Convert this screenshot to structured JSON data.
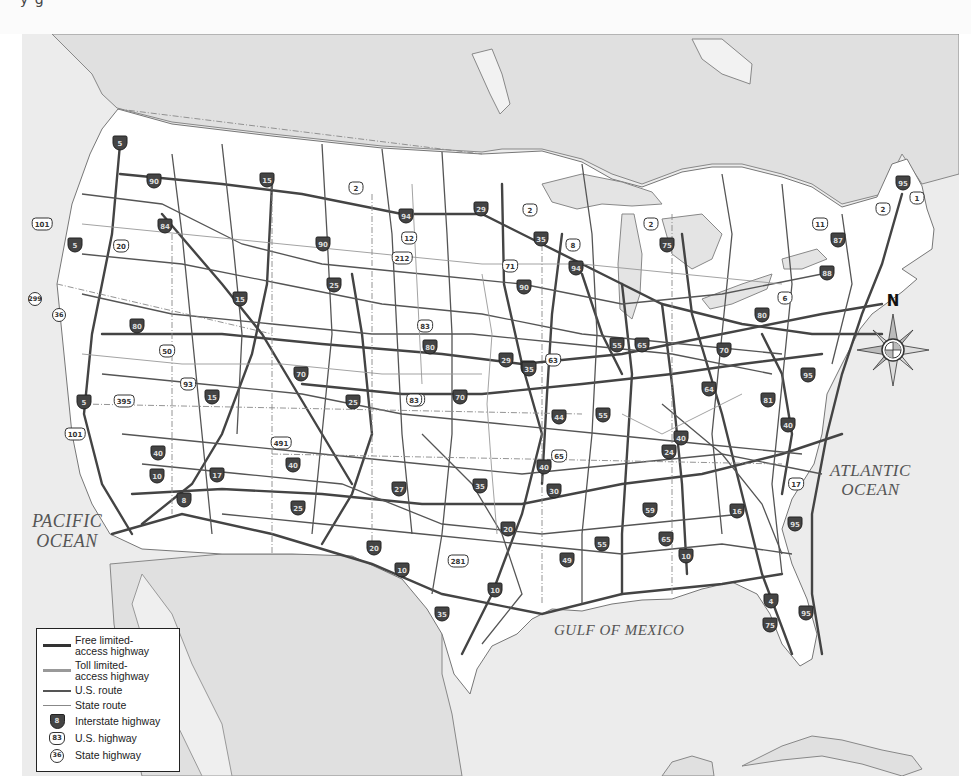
{
  "header": {
    "cropped_text": "y                   g"
  },
  "map": {
    "title": "United States highway map",
    "colors": {
      "foreign_land": "#e2e2e2",
      "water": "#eeeeee",
      "us_land": "#ffffff",
      "interstate": "#444444",
      "toll": "#9a9a9a",
      "us_route": "#555555",
      "state_route": "#888888",
      "border": "#777777"
    },
    "labels": {
      "pacific_ocean": "PACIFIC OCEAN",
      "pacific_line1": "PACIFIC",
      "pacific_line2": "OCEAN",
      "atlantic_ocean": "ATLANTIC OCEAN",
      "atlantic_line1": "ATLANTIC",
      "atlantic_line2": "OCEAN",
      "gulf_of_mexico": "GULF OF MEXICO"
    },
    "compass": {
      "north_label": "N"
    },
    "legend": {
      "items": [
        {
          "symbol": "line-dark-thick",
          "label_line1": "Free limited-",
          "label_line2": "access highway"
        },
        {
          "symbol": "line-gray-thick",
          "label_line1": "Toll limited-",
          "label_line2": "access highway"
        },
        {
          "symbol": "line-dark",
          "label_line1": "U.S. route",
          "label_line2": ""
        },
        {
          "symbol": "line-gray",
          "label_line1": "State route",
          "label_line2": ""
        },
        {
          "symbol": "interstate-shield",
          "shield_text": "8",
          "label_line1": "Interstate highway",
          "label_line2": ""
        },
        {
          "symbol": "us-shield",
          "shield_text": "83",
          "label_line1": "U.S. highway",
          "label_line2": ""
        },
        {
          "symbol": "state-circle",
          "shield_text": "36",
          "label_line1": "State highway",
          "label_line2": ""
        }
      ]
    },
    "shields": [
      {
        "type": "interstate",
        "text": "5",
        "x": 120,
        "y": 143
      },
      {
        "type": "interstate",
        "text": "5",
        "x": 75,
        "y": 245
      },
      {
        "type": "interstate",
        "text": "5",
        "x": 84,
        "y": 402
      },
      {
        "type": "interstate",
        "text": "90",
        "x": 154,
        "y": 181
      },
      {
        "type": "interstate",
        "text": "84",
        "x": 165,
        "y": 226
      },
      {
        "type": "interstate",
        "text": "15",
        "x": 267,
        "y": 180
      },
      {
        "type": "interstate",
        "text": "15",
        "x": 240,
        "y": 299
      },
      {
        "type": "interstate",
        "text": "15",
        "x": 212,
        "y": 397
      },
      {
        "type": "interstate",
        "text": "80",
        "x": 137,
        "y": 326
      },
      {
        "type": "interstate",
        "text": "80",
        "x": 430,
        "y": 347
      },
      {
        "type": "interstate",
        "text": "80",
        "x": 762,
        "y": 315
      },
      {
        "type": "interstate",
        "text": "70",
        "x": 301,
        "y": 374
      },
      {
        "type": "interstate",
        "text": "70",
        "x": 460,
        "y": 397
      },
      {
        "type": "interstate",
        "text": "70",
        "x": 724,
        "y": 350
      },
      {
        "type": "interstate",
        "text": "90",
        "x": 323,
        "y": 244
      },
      {
        "type": "interstate",
        "text": "90",
        "x": 524,
        "y": 287
      },
      {
        "type": "interstate",
        "text": "94",
        "x": 406,
        "y": 216
      },
      {
        "type": "interstate",
        "text": "94",
        "x": 576,
        "y": 268
      },
      {
        "type": "interstate",
        "text": "29",
        "x": 481,
        "y": 209
      },
      {
        "type": "interstate",
        "text": "29",
        "x": 506,
        "y": 360
      },
      {
        "type": "interstate",
        "text": "35",
        "x": 541,
        "y": 239
      },
      {
        "type": "interstate",
        "text": "35",
        "x": 528,
        "y": 368
      },
      {
        "type": "interstate",
        "text": "35",
        "x": 529,
        "y": 369
      },
      {
        "type": "interstate",
        "text": "35",
        "x": 480,
        "y": 486
      },
      {
        "type": "interstate",
        "text": "35",
        "x": 442,
        "y": 614
      },
      {
        "type": "interstate",
        "text": "25",
        "x": 334,
        "y": 285
      },
      {
        "type": "interstate",
        "text": "25",
        "x": 353,
        "y": 402
      },
      {
        "type": "interstate",
        "text": "25",
        "x": 298,
        "y": 508
      },
      {
        "type": "interstate",
        "text": "75",
        "x": 667,
        "y": 245
      },
      {
        "type": "interstate",
        "text": "75",
        "x": 770,
        "y": 625
      },
      {
        "type": "interstate",
        "text": "87",
        "x": 838,
        "y": 240
      },
      {
        "type": "interstate",
        "text": "88",
        "x": 827,
        "y": 273
      },
      {
        "type": "interstate",
        "text": "95",
        "x": 903,
        "y": 183
      },
      {
        "type": "interstate",
        "text": "95",
        "x": 808,
        "y": 375
      },
      {
        "type": "interstate",
        "text": "95",
        "x": 795,
        "y": 524
      },
      {
        "type": "interstate",
        "text": "95",
        "x": 806,
        "y": 613
      },
      {
        "type": "interstate",
        "text": "55",
        "x": 617,
        "y": 345
      },
      {
        "type": "interstate",
        "text": "55",
        "x": 603,
        "y": 415
      },
      {
        "type": "interstate",
        "text": "55",
        "x": 602,
        "y": 544
      },
      {
        "type": "interstate",
        "text": "65",
        "x": 642,
        "y": 345
      },
      {
        "type": "interstate",
        "text": "65",
        "x": 666,
        "y": 539
      },
      {
        "type": "interstate",
        "text": "64",
        "x": 709,
        "y": 389
      },
      {
        "type": "interstate",
        "text": "81",
        "x": 768,
        "y": 400
      },
      {
        "type": "interstate",
        "text": "40",
        "x": 158,
        "y": 453
      },
      {
        "type": "interstate",
        "text": "40",
        "x": 293,
        "y": 465
      },
      {
        "type": "interstate",
        "text": "40",
        "x": 544,
        "y": 467
      },
      {
        "type": "interstate",
        "text": "40",
        "x": 681,
        "y": 438
      },
      {
        "type": "interstate",
        "text": "40",
        "x": 788,
        "y": 425
      },
      {
        "type": "interstate",
        "text": "44",
        "x": 559,
        "y": 417
      },
      {
        "type": "interstate",
        "text": "24",
        "x": 669,
        "y": 452
      },
      {
        "type": "interstate",
        "text": "30",
        "x": 554,
        "y": 491
      },
      {
        "type": "interstate",
        "text": "20",
        "x": 374,
        "y": 548
      },
      {
        "type": "interstate",
        "text": "20",
        "x": 508,
        "y": 529
      },
      {
        "type": "interstate",
        "text": "10",
        "x": 157,
        "y": 476
      },
      {
        "type": "interstate",
        "text": "10",
        "x": 402,
        "y": 570
      },
      {
        "type": "interstate",
        "text": "10",
        "x": 495,
        "y": 590
      },
      {
        "type": "interstate",
        "text": "10",
        "x": 686,
        "y": 556
      },
      {
        "type": "interstate",
        "text": "8",
        "x": 184,
        "y": 500
      },
      {
        "type": "interstate",
        "text": "17",
        "x": 217,
        "y": 475
      },
      {
        "type": "interstate",
        "text": "27",
        "x": 399,
        "y": 489
      },
      {
        "type": "interstate",
        "text": "49",
        "x": 567,
        "y": 560
      },
      {
        "type": "interstate",
        "text": "59",
        "x": 650,
        "y": 510
      },
      {
        "type": "interstate",
        "text": "16",
        "x": 737,
        "y": 511
      },
      {
        "type": "interstate",
        "text": "4",
        "x": 771,
        "y": 601
      },
      {
        "type": "us",
        "text": "101",
        "x": 42,
        "y": 224
      },
      {
        "type": "us",
        "text": "101",
        "x": 75,
        "y": 434
      },
      {
        "type": "us",
        "text": "20",
        "x": 121,
        "y": 246
      },
      {
        "type": "us",
        "text": "2",
        "x": 356,
        "y": 188
      },
      {
        "type": "us",
        "text": "2",
        "x": 530,
        "y": 210
      },
      {
        "type": "us",
        "text": "2",
        "x": 651,
        "y": 224
      },
      {
        "type": "us",
        "text": "2",
        "x": 883,
        "y": 209
      },
      {
        "type": "us",
        "text": "1",
        "x": 917,
        "y": 198
      },
      {
        "type": "us",
        "text": "12",
        "x": 409,
        "y": 238
      },
      {
        "type": "us",
        "text": "212",
        "x": 402,
        "y": 258
      },
      {
        "type": "us",
        "text": "71",
        "x": 510,
        "y": 266
      },
      {
        "type": "us",
        "text": "8",
        "x": 573,
        "y": 245
      },
      {
        "type": "us",
        "text": "11",
        "x": 820,
        "y": 224
      },
      {
        "type": "us",
        "text": "6",
        "x": 785,
        "y": 298
      },
      {
        "type": "us",
        "text": "83",
        "x": 425,
        "y": 326
      },
      {
        "type": "us",
        "text": "83",
        "x": 417,
        "y": 400
      },
      {
        "type": "us",
        "text": "83",
        "x": 414,
        "y": 400
      },
      {
        "type": "us",
        "text": "63",
        "x": 553,
        "y": 360
      },
      {
        "type": "us",
        "text": "50",
        "x": 167,
        "y": 351
      },
      {
        "type": "us",
        "text": "93",
        "x": 188,
        "y": 384
      },
      {
        "type": "us",
        "text": "395",
        "x": 124,
        "y": 401
      },
      {
        "type": "us",
        "text": "491",
        "x": 281,
        "y": 443
      },
      {
        "type": "us",
        "text": "65",
        "x": 559,
        "y": 456
      },
      {
        "type": "us",
        "text": "281",
        "x": 458,
        "y": 561
      },
      {
        "type": "us",
        "text": "17",
        "x": 796,
        "y": 484
      },
      {
        "type": "state",
        "text": "299",
        "x": 35,
        "y": 299
      },
      {
        "type": "state",
        "text": "36",
        "x": 59,
        "y": 315
      }
    ]
  }
}
